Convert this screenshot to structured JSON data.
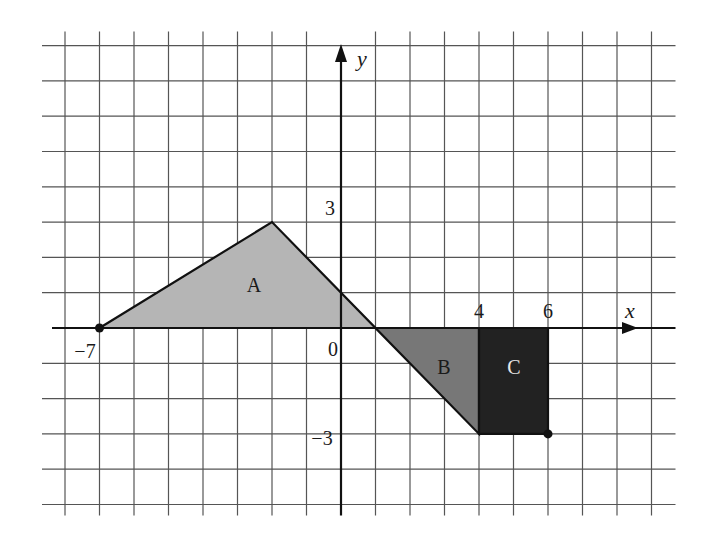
{
  "figure": {
    "type": "coordinate-grid-diagram",
    "axes": {
      "x_label": "x",
      "y_label": "y",
      "origin_label": "0",
      "x_tick_labels": [
        {
          "value": -7,
          "text": "−7"
        },
        {
          "value": 4,
          "text": "4"
        },
        {
          "value": 6,
          "text": "6"
        }
      ],
      "y_tick_labels": [
        {
          "value": 3,
          "text": "3"
        },
        {
          "value": -3,
          "text": "−3"
        }
      ]
    },
    "grid": {
      "x_min": -8,
      "x_max": 9,
      "y_min": -5,
      "y_max": 8,
      "step": 1
    },
    "regions": [
      {
        "name": "A",
        "label": "A",
        "vertices": [
          [
            -7,
            0
          ],
          [
            -2,
            3
          ],
          [
            1,
            0
          ]
        ],
        "fill": "#b5b5b5"
      },
      {
        "name": "B",
        "label": "B",
        "vertices": [
          [
            1,
            0
          ],
          [
            4,
            0
          ],
          [
            4,
            -3
          ]
        ],
        "fill": "#777777"
      },
      {
        "name": "C",
        "label": "C",
        "vertices": [
          [
            4,
            0
          ],
          [
            6,
            0
          ],
          [
            6,
            -3
          ],
          [
            4,
            -3
          ]
        ],
        "fill": "#222222"
      }
    ],
    "points": [
      {
        "name": "point-neg7-0",
        "coords": [
          -7,
          0
        ]
      },
      {
        "name": "point-6-neg3",
        "coords": [
          6,
          -3
        ]
      }
    ],
    "colors": {
      "grid": "#555555",
      "axis": "#111111",
      "region_a": "#b5b5b5",
      "region_b": "#777777",
      "region_c": "#222222",
      "label_on_dark": "#e8e8e8"
    }
  }
}
